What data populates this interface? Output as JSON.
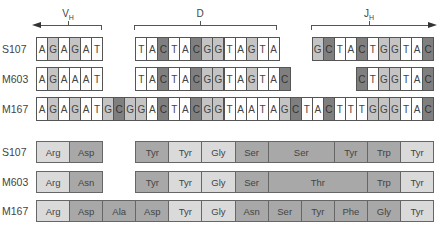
{
  "segments": [
    {
      "label": "V",
      "sub": "H",
      "x1": 36,
      "x2": 102,
      "arrow": "left",
      "tickx": 68
    },
    {
      "label": "D",
      "sub": "",
      "x1": 134,
      "x2": 277,
      "arrow": "none",
      "tickx": 200
    },
    {
      "label": "J",
      "sub": "H",
      "x1": 311,
      "x2": 433,
      "arrow": "right",
      "tickx": 369
    }
  ],
  "colors": {
    "A": "#ffffff",
    "T": "#ffffff",
    "G": "#c4c4c4",
    "C": "#7f7f7f",
    "light": "#dadada",
    "mid": "#a8a8a8"
  },
  "dna_rows": [
    {
      "label": "S107",
      "blocks": [
        {
          "start": 0,
          "seq": "AGAGAT"
        },
        {
          "start": 9,
          "seq": "TACTACGGTAGTA"
        },
        {
          "start": 25,
          "seq": "GCTACTGGTAC"
        }
      ]
    },
    {
      "label": "M603",
      "blocks": [
        {
          "start": 0,
          "seq": "AGAAAT"
        },
        {
          "start": 9,
          "seq": "TACTACGGTAGTAC"
        },
        {
          "start": 29,
          "seq": "CTGGTAC"
        }
      ]
    },
    {
      "label": "M167",
      "blocks": [
        {
          "start": 0,
          "seq": "AGAGATGCGGACTACGGTAATAGCTACTTTGGGTAC"
        }
      ]
    }
  ],
  "protein_rows": [
    {
      "label": "S107",
      "residues": [
        {
          "name": "Arg",
          "start": 0,
          "len": 3,
          "shade": "light"
        },
        {
          "name": "Asp",
          "start": 3,
          "len": 3,
          "shade": "mid"
        },
        {
          "name": "Tyr",
          "start": 9,
          "len": 3,
          "shade": "mid"
        },
        {
          "name": "Tyr",
          "start": 12,
          "len": 3,
          "shade": "light"
        },
        {
          "name": "Gly",
          "start": 15,
          "len": 3,
          "shade": "light"
        },
        {
          "name": "Ser",
          "start": 18,
          "len": 3,
          "shade": "mid"
        },
        {
          "name": "Ser",
          "start": 21,
          "len": 6,
          "shade": "mid"
        },
        {
          "name": "Tyr",
          "start": 27,
          "len": 3,
          "shade": "mid"
        },
        {
          "name": "Trp",
          "start": 30,
          "len": 3,
          "shade": "mid"
        },
        {
          "name": "Tyr",
          "start": 33,
          "len": 3,
          "shade": "light"
        }
      ]
    },
    {
      "label": "M603",
      "residues": [
        {
          "name": "Arg",
          "start": 0,
          "len": 3,
          "shade": "light"
        },
        {
          "name": "Asn",
          "start": 3,
          "len": 3,
          "shade": "mid"
        },
        {
          "name": "Tyr",
          "start": 9,
          "len": 3,
          "shade": "mid"
        },
        {
          "name": "Tyr",
          "start": 12,
          "len": 3,
          "shade": "light"
        },
        {
          "name": "Gly",
          "start": 15,
          "len": 3,
          "shade": "light"
        },
        {
          "name": "Ser",
          "start": 18,
          "len": 3,
          "shade": "mid"
        },
        {
          "name": "Thr",
          "start": 21,
          "len": 9,
          "shade": "mid"
        },
        {
          "name": "Trp",
          "start": 30,
          "len": 3,
          "shade": "mid"
        },
        {
          "name": "Tyr",
          "start": 33,
          "len": 3,
          "shade": "light"
        }
      ]
    },
    {
      "label": "M167",
      "residues": [
        {
          "name": "Arg",
          "start": 0,
          "len": 3,
          "shade": "light"
        },
        {
          "name": "Asp",
          "start": 3,
          "len": 3,
          "shade": "mid"
        },
        {
          "name": "Ala",
          "start": 6,
          "len": 3,
          "shade": "mid"
        },
        {
          "name": "Asp",
          "start": 9,
          "len": 3,
          "shade": "mid"
        },
        {
          "name": "Tyr",
          "start": 12,
          "len": 3,
          "shade": "light"
        },
        {
          "name": "Gly",
          "start": 15,
          "len": 3,
          "shade": "light"
        },
        {
          "name": "Asn",
          "start": 18,
          "len": 3,
          "shade": "mid"
        },
        {
          "name": "Ser",
          "start": 21,
          "len": 3,
          "shade": "mid"
        },
        {
          "name": "Tyr",
          "start": 24,
          "len": 3,
          "shade": "mid"
        },
        {
          "name": "Phe",
          "start": 27,
          "len": 3,
          "shade": "mid"
        },
        {
          "name": "Gly",
          "start": 30,
          "len": 3,
          "shade": "mid"
        },
        {
          "name": "Tyr",
          "start": 33,
          "len": 3,
          "shade": "light"
        }
      ]
    }
  ]
}
